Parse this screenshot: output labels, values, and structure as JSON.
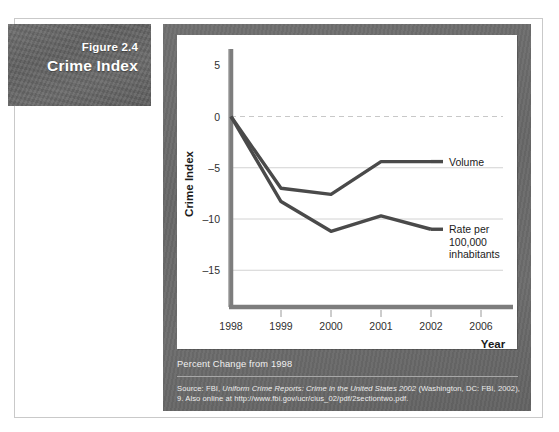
{
  "figure": {
    "number": "Figure 2.4",
    "title": "Crime Index"
  },
  "caption": {
    "note": "Percent Change from 1998",
    "source_prefix": "Source: FBI, ",
    "source_italic": "Uniform Crime Reports: Crime in the United States 2002",
    "source_suffix": " (Washington, DC: FBI, 2002), 9. Also online at http://www.fbi.gov/ucr/cius_02/pdf/2sectiontwo.pdf."
  },
  "colors": {
    "plate_grey": "#686868",
    "panel_grey": "#6b6b6b",
    "line_dark": "#4a4a4a",
    "gridline": "#d2d2d2",
    "zero_line": "#c8c8c8",
    "axis": "#7d7d7d",
    "plot_bg": "#ffffff"
  },
  "chart_data": {
    "type": "line",
    "title": "Crime Index",
    "xlabel": "Year",
    "ylabel": "Crime Index",
    "x": [
      "1998",
      "1999",
      "2000",
      "2001",
      "2002"
    ],
    "xtick_labels": [
      "1998",
      "1999",
      "2000",
      "2001",
      "2002",
      "2006"
    ],
    "ytick_labels": [
      "5",
      "0",
      "-5",
      "-10",
      "-15"
    ],
    "yticks": [
      5,
      0,
      -5,
      -10,
      -15
    ],
    "ylim": [
      -18,
      6
    ],
    "grid": "horizontal",
    "zero_reference_line": true,
    "legend_position": "right-inline",
    "series": [
      {
        "name": "Volume",
        "label": "Volume",
        "values": [
          0,
          -7.0,
          -7.6,
          -4.4,
          -4.4
        ]
      },
      {
        "name": "Rate per 100,000 inhabitants",
        "label_lines": [
          "Rate per",
          "100,000",
          "inhabitants"
        ],
        "values": [
          0,
          -8.3,
          -11.2,
          -9.7,
          -11.0
        ]
      }
    ]
  }
}
